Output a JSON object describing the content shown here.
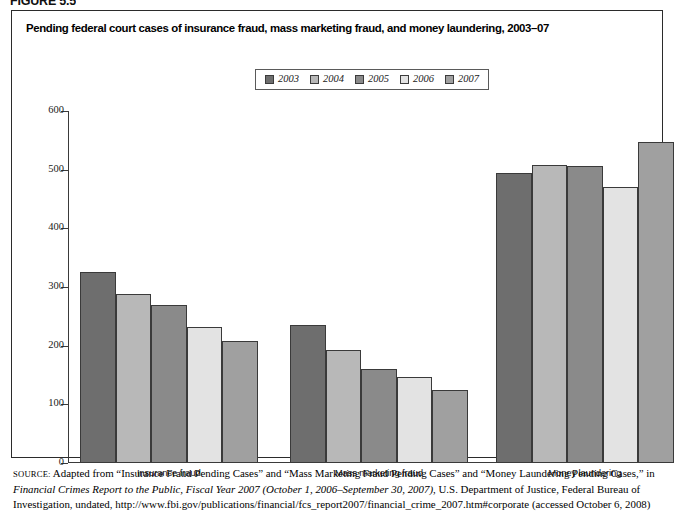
{
  "figure_number": "FIGURE 5.5",
  "title": "Pending federal court cases of insurance fraud, mass marketing fraud, and money laundering, 2003–07",
  "legend": {
    "items": [
      {
        "label": "2003",
        "color": "#6e6e6e"
      },
      {
        "label": "2004",
        "color": "#b8b8b8"
      },
      {
        "label": "2005",
        "color": "#8a8a8a"
      },
      {
        "label": "2006",
        "color": "#e3e3e3"
      },
      {
        "label": "2007",
        "color": "#a0a0a0"
      }
    ]
  },
  "axis": {
    "y_ticks": [
      "0",
      "100",
      "200",
      "300",
      "400",
      "500",
      "600"
    ],
    "x_categories": [
      "Insurance fraud",
      "Mass marketing fraud",
      "Money laundering"
    ]
  },
  "source": {
    "label": "SOURCE:",
    "text_1": " Adapted from “Insurance Fraud Pending Cases” and “Mass Marketing Fraud Pending Cases” and “Money Laundering Pending Cases,” in ",
    "text_italic": "Financial Crimes Report to the Public, Fiscal Year 2007 (October 1, 2006–September 30, 2007)",
    "text_2": ", U.S. Department of Justice, Federal Bureau of Investigation, undated, http://www.fbi.gov/publications/financial/fcs_report2007/financial_crime_2007.htm#corporate (accessed October 6, 2008)"
  },
  "chart_data": {
    "type": "bar",
    "title": "Pending federal court cases of insurance fraud, mass marketing fraud, and money laundering, 2003–07",
    "xlabel": "",
    "ylabel": "",
    "ylim": [
      0,
      600
    ],
    "ytick_step": 100,
    "grid": false,
    "legend_position": "top-center",
    "categories": [
      "Insurance fraud",
      "Mass marketing fraud",
      "Money laundering"
    ],
    "series": [
      {
        "name": "2003",
        "color": "#6e6e6e",
        "values": [
          325,
          235,
          495
        ]
      },
      {
        "name": "2004",
        "color": "#b8b8b8",
        "values": [
          288,
          192,
          508
        ]
      },
      {
        "name": "2005",
        "color": "#8a8a8a",
        "values": [
          270,
          160,
          506
        ]
      },
      {
        "name": "2006",
        "color": "#e3e3e3",
        "values": [
          232,
          146,
          470
        ]
      },
      {
        "name": "2007",
        "color": "#a0a0a0",
        "values": [
          208,
          125,
          547
        ]
      }
    ]
  }
}
